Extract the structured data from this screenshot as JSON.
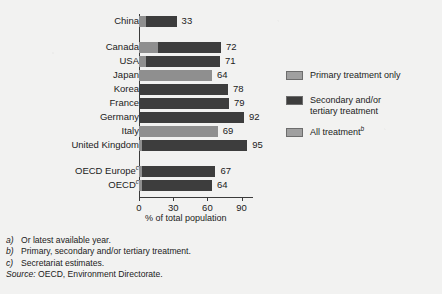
{
  "chart_data": {
    "type": "bar",
    "orientation": "horizontal",
    "title": "",
    "xlabel": "% of total population",
    "ylabel": "",
    "xlim": [
      0,
      100
    ],
    "xticks": [
      0,
      30,
      60,
      90
    ],
    "grid": false,
    "legend_position": "right",
    "categories": [
      "China",
      "Canada",
      "USA",
      "Japan",
      "Korea",
      "France",
      "Germany",
      "Italy",
      "United Kingdom",
      "OECD Europe",
      "OECD"
    ],
    "series": [
      {
        "name": "Primary treatment only",
        "color": "#8f8f8f",
        "values": [
          6,
          17,
          6,
          0,
          0,
          0,
          0,
          0,
          3,
          3,
          3
        ]
      },
      {
        "name": "Secondary and/or tertiary treatment",
        "color": "#3d3d3d",
        "values": [
          27,
          55,
          65,
          0,
          78,
          79,
          92,
          0,
          92,
          64,
          61
        ]
      },
      {
        "name": "All treatment",
        "color": "#8f8f8f",
        "values": [
          0,
          0,
          0,
          64,
          0,
          0,
          0,
          69,
          0,
          0,
          0
        ]
      }
    ],
    "totals": [
      33,
      72,
      71,
      64,
      78,
      79,
      92,
      69,
      95,
      67,
      64
    ]
  },
  "rows": [
    {
      "label": "China",
      "sup": "",
      "total": "33",
      "light": 6,
      "dark": 27,
      "all": 0,
      "top": 16
    },
    {
      "label": "Canada",
      "sup": "",
      "total": "72",
      "light": 17,
      "dark": 55,
      "all": 0,
      "top": 42
    },
    {
      "label": "USA",
      "sup": "",
      "total": "71",
      "light": 6,
      "dark": 65,
      "all": 0,
      "top": 56
    },
    {
      "label": "Japan",
      "sup": "",
      "total": "64",
      "light": 0,
      "dark": 0,
      "all": 64,
      "top": 70
    },
    {
      "label": "Korea",
      "sup": "",
      "total": "78",
      "light": 0,
      "dark": 78,
      "all": 0,
      "top": 84
    },
    {
      "label": "France",
      "sup": "",
      "total": "79",
      "light": 0,
      "dark": 79,
      "all": 0,
      "top": 98
    },
    {
      "label": "Germany",
      "sup": "",
      "total": "92",
      "light": 0,
      "dark": 92,
      "all": 0,
      "top": 112
    },
    {
      "label": "Italy",
      "sup": "",
      "total": "69",
      "light": 0,
      "dark": 0,
      "all": 69,
      "top": 126
    },
    {
      "label": "United Kingdom",
      "sup": "",
      "total": "95",
      "light": 3,
      "dark": 92,
      "all": 0,
      "top": 140
    },
    {
      "label": "OECD Europe",
      "sup": "c",
      "total": "67",
      "light": 3,
      "dark": 64,
      "all": 0,
      "top": 166
    },
    {
      "label": "OECD",
      "sup": "c",
      "total": "64",
      "light": 3,
      "dark": 61,
      "all": 0,
      "top": 180
    }
  ],
  "axis": {
    "ticks": [
      {
        "value": "0",
        "pos": 0
      },
      {
        "value": "30",
        "pos": 30
      },
      {
        "value": "60",
        "pos": 60
      },
      {
        "value": "90",
        "pos": 90
      }
    ],
    "title": "% of total population"
  },
  "legend": {
    "items": [
      {
        "label": "Primary treatment only",
        "sup": "",
        "swatch": "light"
      },
      {
        "label": "Secondary and/or\ntertiary treatment",
        "sup": "",
        "swatch": "dark"
      },
      {
        "label": "All treatment",
        "sup": "b",
        "swatch": "light"
      }
    ]
  },
  "notes": {
    "items": [
      {
        "marker": "a)",
        "text": "Or latest available year."
      },
      {
        "marker": "b)",
        "text": "Primary, secondary and/or tertiary treatment."
      },
      {
        "marker": "c)",
        "text": "Secretariat estimates."
      }
    ],
    "source_label": "Source:",
    "source_text": "OECD, Environment Directorate."
  }
}
